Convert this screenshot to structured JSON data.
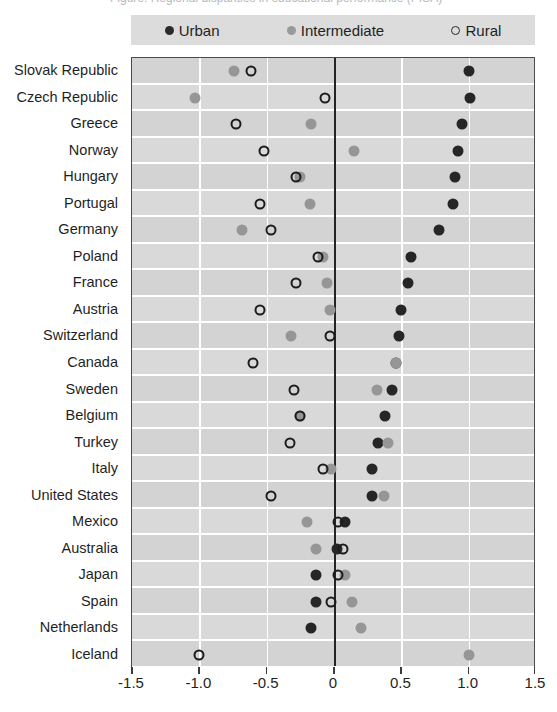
{
  "title_sliver": "Figure: Regional disparities in educational performance (PISA)",
  "legend": {
    "position": "top",
    "items": [
      {
        "label": "Urban",
        "marker": "filled-dark-circle-icon",
        "color": "#262626"
      },
      {
        "label": "Intermediate",
        "marker": "filled-gray-circle-icon",
        "color": "#969696"
      },
      {
        "label": "Rural",
        "marker": "open-circle-icon",
        "color": "#1c1c1c"
      }
    ]
  },
  "chart_data": {
    "type": "scatter",
    "title": "",
    "subtitle": "",
    "xlabel": "",
    "ylabel": "",
    "xlim": [
      -1.5,
      1.5
    ],
    "xticks": [
      -1.5,
      -1.0,
      -0.5,
      0,
      0.5,
      1.0,
      1.5
    ],
    "xticklabels": [
      "-1.5",
      "-1.0",
      "-0.5",
      "0",
      "0.5",
      "1.0",
      "1.5"
    ],
    "grid": "vertical-gridlines-at-ticks",
    "zero_reference_line": 0,
    "orientation": "horizontal-dot-plot",
    "legend_position": "top",
    "categories": [
      "Slovak Republic",
      "Czech Republic",
      "Greece",
      "Norway",
      "Hungary",
      "Portugal",
      "Germany",
      "Poland",
      "France",
      "Austria",
      "Switzerland",
      "Canada",
      "Sweden",
      "Belgium",
      "Turkey",
      "Italy",
      "United States",
      "Mexico",
      "Australia",
      "Japan",
      "Spain",
      "Netherlands",
      "Iceland"
    ],
    "series": [
      {
        "name": "Urban",
        "marker": "filled-dark-circle",
        "color": "#262626",
        "values": [
          1.0,
          1.01,
          0.95,
          0.92,
          0.9,
          0.88,
          0.78,
          0.57,
          0.55,
          0.5,
          0.48,
          0.46,
          0.43,
          0.38,
          0.33,
          0.28,
          0.28,
          0.08,
          0.02,
          -0.13,
          -0.13,
          -0.17,
          null
        ]
      },
      {
        "name": "Intermediate",
        "marker": "filled-gray-circle",
        "color": "#969696",
        "values": [
          -0.74,
          -1.03,
          -0.17,
          0.15,
          -0.25,
          -0.18,
          -0.68,
          -0.08,
          -0.05,
          -0.03,
          -0.32,
          0.46,
          0.32,
          -0.25,
          0.4,
          -0.02,
          0.37,
          -0.2,
          -0.13,
          0.08,
          0.13,
          0.2,
          1.0
        ]
      },
      {
        "name": "Rural",
        "marker": "open-circle",
        "color": "#1c1c1c",
        "values": [
          -0.62,
          -0.07,
          -0.73,
          -0.52,
          -0.28,
          -0.55,
          -0.47,
          -0.12,
          -0.28,
          -0.55,
          -0.03,
          -0.6,
          -0.3,
          -0.25,
          -0.33,
          -0.08,
          -0.47,
          0.03,
          0.07,
          0.03,
          -0.02,
          null,
          -1.0
        ]
      }
    ]
  }
}
